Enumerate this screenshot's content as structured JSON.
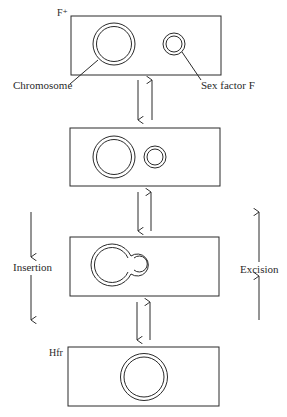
{
  "diagram": {
    "stages": [
      {
        "label": "F⁺",
        "state": "separate"
      },
      {
        "label": "",
        "state": "approaching"
      },
      {
        "label": "",
        "state": "fused"
      },
      {
        "label": "Hfr",
        "state": "integrated"
      }
    ],
    "annotations": {
      "chromosome": "Chromosome",
      "sex_factor": "Sex factor F"
    },
    "processes": {
      "left": "Insertion",
      "right": "Excision"
    },
    "colors": {
      "line": "#2a2a2a",
      "background": "#ffffff"
    }
  }
}
